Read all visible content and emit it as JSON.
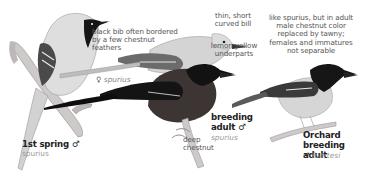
{
  "plate": {
    "subject": "Orchard Oriole plumages",
    "colors": {
      "background": "#ffffff",
      "annotation_text": "#555555",
      "label_text": "#222222",
      "subspecies_text": "#9a9a9a",
      "black_plumage": "#151515",
      "chestnut_underparts": "#3d3434",
      "pale_body": "#d9d9d9",
      "female_body": "#cfcfcf",
      "branch": "#c9c4c4"
    }
  },
  "annotations": {
    "bib": {
      "lines": [
        "black bib often bordered",
        "by a few chestnut",
        "feathers"
      ]
    },
    "bill": {
      "lines": [
        "thin, short",
        "curved bill"
      ]
    },
    "underparts": {
      "lines": [
        "lemon yellow",
        "underparts"
      ]
    },
    "fuertesi_note": {
      "lines": [
        "like spurius, but in adult",
        "male chestnut color",
        "replaced by tawny;",
        "females and immatures",
        "not separable"
      ]
    },
    "chestnut": {
      "lines": [
        "deep",
        "chestnut"
      ]
    }
  },
  "birds": [
    {
      "id": "first-spring-male",
      "label": "1st spring ♂",
      "subspecies": "spurius"
    },
    {
      "id": "female",
      "label": "♀",
      "subspecies": "spurius"
    },
    {
      "id": "breeding-adult-male",
      "label_lines": [
        "breeding",
        "adult ♂"
      ],
      "subspecies": "spurius"
    },
    {
      "id": "orchard-fuertesi-male",
      "label_lines": [
        "Orchard",
        "breeding adult"
      ],
      "sex_symbol": "♂",
      "subspecies": "fuertesi"
    }
  ]
}
